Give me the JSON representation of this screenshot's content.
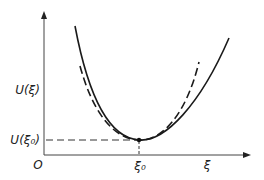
{
  "diagram": {
    "type": "potential-energy-curve",
    "axes": {
      "y_label": "U(ξ)",
      "y_tick_label": "U(ξ₀)",
      "origin_label": "O",
      "x_tick_label": "ξ₀",
      "x_label": "ξ"
    },
    "curves": [
      {
        "name": "actual potential",
        "style": "solid"
      },
      {
        "name": "harmonic approximation",
        "style": "dashed"
      }
    ],
    "minimum_point": {
      "x_label": "ξ₀",
      "y_label": "U(ξ₀)"
    },
    "colors": {
      "ink": "#222222",
      "background": "#ffffff"
    }
  }
}
